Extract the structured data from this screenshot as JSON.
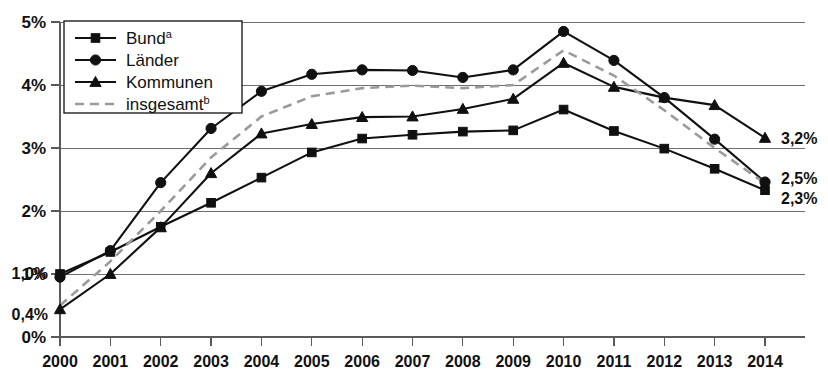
{
  "chart_data": {
    "type": "line",
    "title": "",
    "xlabel": "",
    "ylabel": "",
    "grid": true,
    "legend_position": "top-left",
    "categories": [
      "2000",
      "2001",
      "2002",
      "2003",
      "2004",
      "2005",
      "2006",
      "2007",
      "2008",
      "2009",
      "2010",
      "2011",
      "2012",
      "2013",
      "2014"
    ],
    "x": [
      2000,
      2001,
      2002,
      2003,
      2004,
      2005,
      2006,
      2007,
      2008,
      2009,
      2010,
      2011,
      2012,
      2013,
      2014
    ],
    "ylim": [
      0,
      5
    ],
    "xlim": [
      2000,
      2014
    ],
    "ytick_labels": [
      "0%",
      "1%",
      "2%",
      "3%",
      "4%",
      "5%"
    ],
    "ytick_values": [
      0,
      1,
      2,
      3,
      4,
      5
    ],
    "series": [
      {
        "name": "Bund",
        "name_sup": "a",
        "marker": "square",
        "style": "solid",
        "color": "#101010",
        "values": [
          1.0,
          1.35,
          1.75,
          2.13,
          2.53,
          2.93,
          3.15,
          3.21,
          3.26,
          3.28,
          3.61,
          3.27,
          2.99,
          2.67,
          2.33
        ]
      },
      {
        "name": "Länder",
        "name_sup": "",
        "marker": "circle",
        "style": "solid",
        "color": "#101010",
        "values": [
          0.95,
          1.37,
          2.45,
          3.31,
          3.9,
          4.17,
          4.24,
          4.23,
          4.12,
          4.24,
          4.85,
          4.39,
          3.8,
          3.14,
          2.46
        ]
      },
      {
        "name": "Kommunen",
        "name_sup": "",
        "marker": "triangle",
        "style": "solid",
        "color": "#101010",
        "values": [
          0.44,
          1.0,
          1.74,
          2.6,
          3.23,
          3.38,
          3.49,
          3.5,
          3.62,
          3.78,
          4.35,
          3.97,
          3.8,
          3.68,
          3.16
        ]
      },
      {
        "name": "insgesamt",
        "name_sup": "b",
        "marker": "none",
        "style": "dashed",
        "color": "#9a9a9a",
        "values": [
          0.5,
          1.2,
          2.0,
          2.85,
          3.5,
          3.82,
          3.95,
          3.99,
          3.95,
          4.0,
          4.55,
          4.15,
          3.6,
          3.0,
          2.44
        ]
      }
    ],
    "point_labels": [
      {
        "text": "1,0%",
        "series": "Bund",
        "year": 2000,
        "side": "left"
      },
      {
        "text": "0,4%",
        "series": "Kommunen",
        "year": 2000,
        "side": "left"
      },
      {
        "text": "3,2%",
        "series": "Kommunen",
        "year": 2014,
        "side": "right"
      },
      {
        "text": "2,5%",
        "series": "Länder",
        "year": 2014,
        "side": "right"
      },
      {
        "text": "2,3%",
        "series": "Bund",
        "year": 2014,
        "side": "right"
      }
    ]
  },
  "legend": {
    "items": [
      {
        "label": "Bund",
        "sup": "a",
        "marker": "square",
        "style": "solid"
      },
      {
        "label": "Länder",
        "sup": "",
        "marker": "circle",
        "style": "solid"
      },
      {
        "label": "Kommunen",
        "sup": "",
        "marker": "triangle",
        "style": "solid"
      },
      {
        "label": "insgesamt",
        "sup": "b",
        "marker": "none",
        "style": "dashed"
      }
    ]
  },
  "colors": {
    "series_dark": "#101010",
    "series_gray": "#9a9a9a",
    "gridline": "#6e6e6e",
    "axis": "#5a5a5a",
    "background": "#ffffff"
  }
}
